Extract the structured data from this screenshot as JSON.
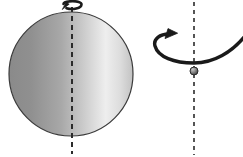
{
  "figure": {
    "background_color": "#ffffff",
    "width": 243,
    "height": 157
  },
  "sphere": {
    "name": "large-shaded-sphere",
    "center_x": 71,
    "center_y": 74,
    "radius": 62,
    "outline_color": "#3a3a3a",
    "gradient_stops": [
      {
        "offset": "0%",
        "color": "#8a8a8a"
      },
      {
        "offset": "18%",
        "color": "#909090"
      },
      {
        "offset": "42%",
        "color": "#a8a8a8"
      },
      {
        "offset": "62%",
        "color": "#cfcfcf"
      },
      {
        "offset": "78%",
        "color": "#eeeeee"
      },
      {
        "offset": "90%",
        "color": "#dcdcdc"
      },
      {
        "offset": "100%",
        "color": "#c2c2c2"
      }
    ]
  },
  "small_sphere": {
    "name": "small-shaded-sphere",
    "center_x": 194,
    "center_y": 71,
    "radius": 4,
    "outline_color": "#2b2b2b",
    "gradient_stops": [
      {
        "offset": "0%",
        "color": "#c9c9c9"
      },
      {
        "offset": "45%",
        "color": "#8f8f8f"
      },
      {
        "offset": "100%",
        "color": "#3c3c3c"
      }
    ]
  },
  "axes": [
    {
      "name": "sphere-rotation-axis",
      "x": 72,
      "y_start": 7,
      "y_end": 154,
      "color": "#2b2b2b",
      "dash": "5 4",
      "width": 2
    },
    {
      "name": "point-rotation-axis",
      "x": 194,
      "y_start": 2,
      "y_end": 155,
      "color": "#2b2b2b",
      "dash": "4 4",
      "width": 1.6
    }
  ],
  "arrows": [
    {
      "name": "sphere-spin-arrow",
      "description": "small curved rotation arrow around the top of the sphere axis",
      "color": "#1a1a1a",
      "stroke_width": 2.6
    },
    {
      "name": "point-revolution-arrow",
      "description": "large curved rotation arrow around the right-hand axis",
      "color": "#1a1a1a",
      "stroke_width": 3.4
    }
  ],
  "labels": {
    "sphere_caption": "",
    "point_caption": ""
  }
}
